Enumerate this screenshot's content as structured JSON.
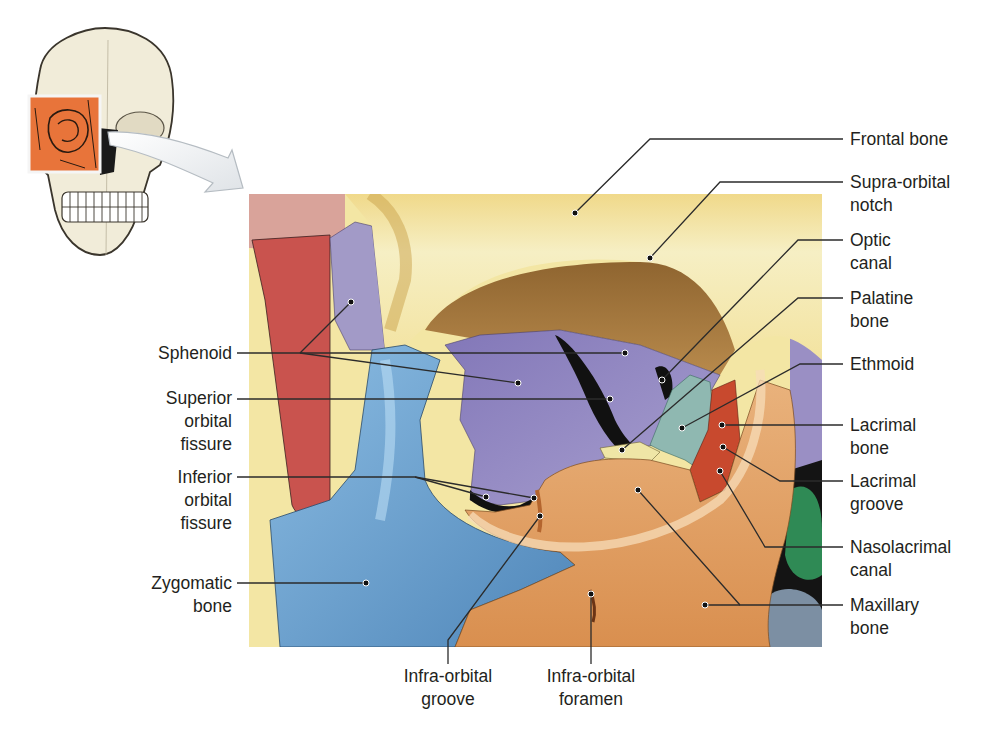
{
  "diagram": {
    "inset": {
      "description": "Skull with orbit region highlighted",
      "highlight_color": "#e8743a",
      "arrow_color": "#eef0f2"
    },
    "colors": {
      "frontal": "#f3e7a6",
      "frontal_shadow": "#a9824c",
      "sphenoid": "#9a8fc4",
      "zygomatic": "#6ea3cf",
      "maxillary": "#e3a469",
      "ethmoid": "#8fb8b1",
      "lacrimal": "#c8492e",
      "palatine": "#efe6a6",
      "parietal_red": "#c9534e",
      "nasal_green": "#2f8a55",
      "fissure_black": "#111111",
      "leader_line": "#2b2b2b"
    },
    "labels": {
      "left": [
        {
          "id": "sphenoid",
          "text": "Sphenoid"
        },
        {
          "id": "superior-orbital-fissure",
          "text": "Superior\norbital\nfissure"
        },
        {
          "id": "inferior-orbital-fissure",
          "text": "Inferior\norbital\nfissure"
        },
        {
          "id": "zygomatic-bone",
          "text": "Zygomatic\nbone"
        }
      ],
      "right": [
        {
          "id": "frontal-bone",
          "text": "Frontal bone"
        },
        {
          "id": "supra-orbital-notch",
          "text": "Supra-orbital\nnotch"
        },
        {
          "id": "optic-canal",
          "text": "Optic\ncanal"
        },
        {
          "id": "palatine-bone",
          "text": "Palatine\nbone"
        },
        {
          "id": "ethmoid",
          "text": "Ethmoid"
        },
        {
          "id": "lacrimal-bone",
          "text": "Lacrimal\nbone"
        },
        {
          "id": "lacrimal-groove",
          "text": "Lacrimal\ngroove"
        },
        {
          "id": "nasolacrimal-canal",
          "text": "Nasolacrimal\ncanal"
        },
        {
          "id": "maxillary-bone",
          "text": "Maxillary\nbone"
        }
      ],
      "bottom": [
        {
          "id": "infra-orbital-groove",
          "text": "Infra-orbital\ngroove"
        },
        {
          "id": "infra-orbital-foramen",
          "text": "Infra-orbital\nforamen"
        }
      ]
    }
  }
}
